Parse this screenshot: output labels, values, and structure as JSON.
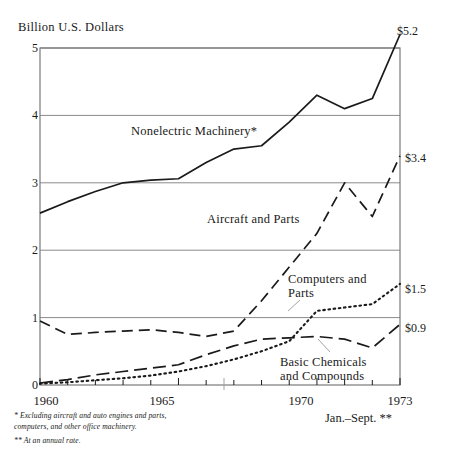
{
  "chart_data": {
    "type": "line",
    "title": "Billion U.S. Dollars",
    "xlabel": "",
    "ylabel": "Billion U.S. Dollars",
    "xlim": [
      1960,
      1973
    ],
    "ylim": [
      0,
      5
    ],
    "yticks": [
      "0",
      "1",
      "2",
      "3",
      "4",
      "5"
    ],
    "ytick_values": [
      0,
      1,
      2,
      3,
      4,
      5
    ],
    "xticks": [
      "1960",
      "1965",
      "1970",
      "1973"
    ],
    "xtick_values": [
      1960,
      1965,
      1970,
      1973
    ],
    "grid": "horizontal",
    "legend_position": "inline-annotations",
    "x": [
      1960,
      1961,
      1962,
      1963,
      1964,
      1965,
      1966,
      1967,
      1968,
      1969,
      1970,
      1971,
      1972,
      1973
    ],
    "series": [
      {
        "name": "Nonelectric Machinery*",
        "style": "solid",
        "end_value_label": "$5.2",
        "values": [
          2.55,
          2.72,
          2.87,
          3.0,
          3.04,
          3.06,
          3.3,
          3.5,
          3.55,
          3.9,
          4.3,
          4.1,
          4.25,
          5.2
        ]
      },
      {
        "name": "Aircraft and Parts",
        "style": "dashed",
        "end_value_label": "$3.4",
        "values": [
          0.95,
          0.75,
          0.78,
          0.8,
          0.82,
          0.78,
          0.72,
          0.8,
          1.25,
          1.75,
          2.25,
          3.0,
          2.5,
          3.4
        ]
      },
      {
        "name": "Computers and Parts",
        "style": "dotted",
        "end_value_label": "$1.5",
        "values": [
          0.02,
          0.04,
          0.07,
          0.1,
          0.14,
          0.2,
          0.28,
          0.38,
          0.5,
          0.65,
          1.1,
          1.15,
          1.2,
          1.5
        ]
      },
      {
        "name": "Basic Chemicals and Compounds",
        "style": "dash-dot",
        "end_value_label": "$0.9",
        "values": [
          0.03,
          0.08,
          0.15,
          0.2,
          0.25,
          0.3,
          0.45,
          0.58,
          0.68,
          0.7,
          0.72,
          0.68,
          0.55,
          0.9
        ]
      }
    ],
    "annotations": [
      {
        "text": "Nonelectric Machinery*",
        "series": "Nonelectric Machinery*"
      },
      {
        "text": "Aircraft and Parts",
        "series": "Aircraft and Parts"
      },
      {
        "text": "Computers and",
        "series": "Computers and Parts"
      },
      {
        "text": "Parts",
        "series": "Computers and Parts"
      },
      {
        "text": "Basic Chemicals",
        "series": "Basic Chemicals and Compounds"
      },
      {
        "text": "and Compounds",
        "series": "Basic Chemicals and Compounds"
      }
    ]
  },
  "labels": {
    "axis_title": "Billion U.S. Dollars",
    "ytick_5": "5",
    "ytick_4": "4",
    "ytick_3": "3",
    "ytick_2": "2",
    "ytick_1": "1",
    "ytick_0": "0",
    "xtick_1960": "1960",
    "xtick_1965": "1965",
    "xtick_1970": "1970",
    "xtick_1973": "1973",
    "end_nonelectric": "$5.2",
    "end_aircraft": "$3.4",
    "end_computers": "$1.5",
    "end_chemicals": "$0.9",
    "series_nonelectric": "Nonelectric Machinery*",
    "series_aircraft": "Aircraft and Parts",
    "series_computers_line1": "Computers and",
    "series_computers_line2": "Parts",
    "series_chemicals_line1": "Basic Chemicals",
    "series_chemicals_line2": "and Compounds",
    "annual_rate_note": "Jan.–Sept. **"
  },
  "footnotes": {
    "line1": "* Excluding aircraft and auto engines and parts,",
    "line2": "computers, and other office machinery.",
    "line3": "** At an annual rate."
  },
  "colors": {
    "ink": "#1a1a1a",
    "grid": "#8a8a8a",
    "frame": "#7a7a7a",
    "background": "#ffffff"
  }
}
